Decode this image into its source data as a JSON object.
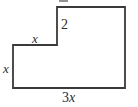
{
  "figure": {
    "background_color": "#ffffff",
    "stroke_color": "#3a3a3a",
    "stroke_width": 1.8,
    "text_color": "#2e2e2e",
    "canvas": {
      "width": 138,
      "height": 107
    }
  },
  "shape": {
    "name": "l-shaped-hexagon",
    "sides": 6,
    "vertices": [
      {
        "x": 13,
        "y": 45
      },
      {
        "x": 57,
        "y": 45
      },
      {
        "x": 57,
        "y": 7
      },
      {
        "x": 125,
        "y": 7
      },
      {
        "x": 125,
        "y": 88
      },
      {
        "x": 13,
        "y": 88
      }
    ],
    "path": "M 13 45 L 57 45 L 57 7 L 125 7 L 125 88 L 13 88 Z"
  },
  "labels": {
    "side_left": "x",
    "side_top_left": "x",
    "side_notch": "2",
    "side_bottom_coefficient": "3",
    "side_bottom_variable": "x",
    "side_bottom_full": "3x"
  }
}
